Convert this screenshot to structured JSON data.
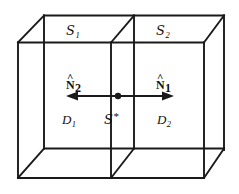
{
  "figure": {
    "background_color": "#ffffff",
    "line_color": "#1a1a1a",
    "text_color": "#111111",
    "width": 239,
    "height": 194
  },
  "labels": {
    "surface_1": {
      "symbol": "S",
      "subscript": "1",
      "text": "S1"
    },
    "surface_2": {
      "symbol": "S",
      "subscript": "2",
      "text": "S2"
    },
    "normal_2": {
      "symbol": "N",
      "subscript": "2",
      "accent": "hat",
      "text": "N2"
    },
    "normal_1": {
      "symbol": "N",
      "subscript": "1",
      "accent": "hat",
      "text": "N1"
    },
    "domain_1": {
      "symbol": "D",
      "subscript": "1",
      "text": "D1"
    },
    "interface": {
      "symbol": "S",
      "superscript": "*",
      "text": "S*"
    },
    "domain_2": {
      "symbol": "D",
      "subscript": "2",
      "text": "D2"
    },
    "hat_glyph": "^",
    "star_glyph": "*"
  },
  "geometry": {
    "front_face": {
      "left": 18,
      "right": 204,
      "top": 42.5,
      "bottom": 178
    },
    "depth_offset": {
      "dx": 26,
      "dy": -27
    },
    "partition_front_x": 111,
    "partition_back_x": 134,
    "arrow": {
      "y": 96,
      "left_tip_x": 70,
      "right_tip_x": 170,
      "center_dot_x": 118,
      "dot_radius": 3.2,
      "stroke_width": 2.2
    }
  }
}
